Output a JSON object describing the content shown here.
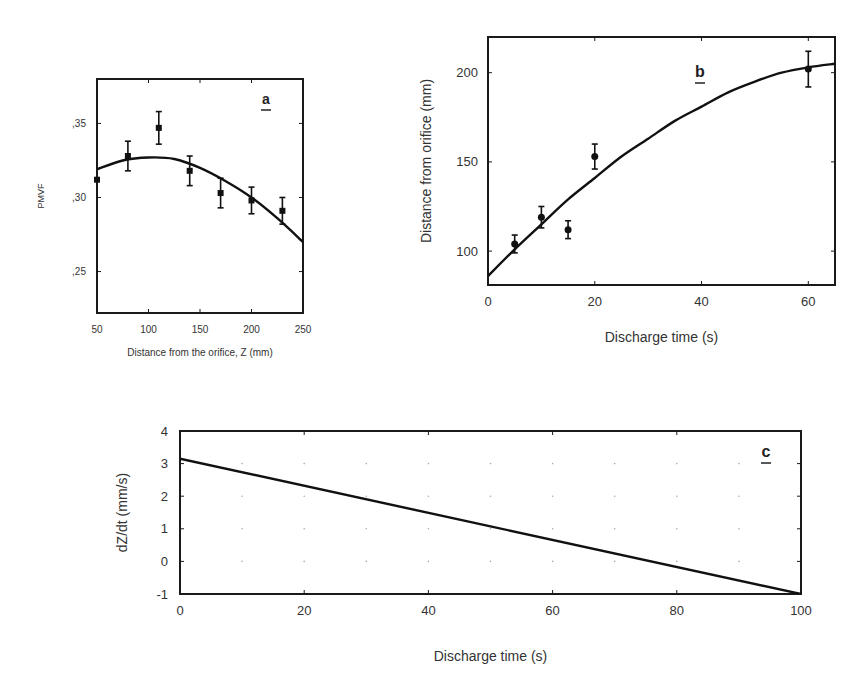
{
  "chart_data": [
    {
      "id": "a",
      "type": "scatter",
      "panel_label": "a",
      "title": "",
      "xlabel": "Distance from the orifice, Z  (mm)",
      "ylabel": "PMVF",
      "xlim": [
        50,
        250
      ],
      "ylim": [
        0.222,
        0.38
      ],
      "xticks": [
        50,
        100,
        150,
        200,
        250
      ],
      "xtick_labels": [
        "50",
        "100",
        "150",
        "200",
        "250"
      ],
      "yticks": [
        0.25,
        0.3,
        0.35
      ],
      "ytick_labels": [
        ",25",
        ",30",
        ",35"
      ],
      "grid": false,
      "series": [
        {
          "name": "measured",
          "marker": "square",
          "x": [
            50,
            80,
            110,
            140,
            170,
            200,
            230
          ],
          "y": [
            0.312,
            0.328,
            0.347,
            0.318,
            0.303,
            0.298,
            0.291
          ],
          "error": [
            0.0,
            0.01,
            0.011,
            0.01,
            0.01,
            0.009,
            0.009
          ]
        },
        {
          "name": "fit",
          "style": "line",
          "x": [
            50,
            75,
            100,
            125,
            150,
            175,
            200,
            225,
            250
          ],
          "y": [
            0.319,
            0.325,
            0.327,
            0.326,
            0.32,
            0.311,
            0.3,
            0.286,
            0.27
          ]
        }
      ]
    },
    {
      "id": "b",
      "type": "scatter",
      "panel_label": "b",
      "title": "",
      "xlabel": "Discharge time  (s)",
      "ylabel": "Distance from orifice (mm)",
      "xlim": [
        0,
        65
      ],
      "ylim": [
        81,
        220
      ],
      "xticks": [
        0,
        20,
        40,
        60
      ],
      "xtick_labels": [
        "0",
        "20",
        "40",
        "60"
      ],
      "yticks": [
        100,
        150,
        200
      ],
      "ytick_labels": [
        "100",
        "150",
        "200"
      ],
      "grid": false,
      "series": [
        {
          "name": "measured",
          "marker": "circle",
          "x": [
            5,
            10,
            15,
            20,
            60
          ],
          "y": [
            104,
            119,
            112,
            153,
            202
          ],
          "error": [
            5,
            6,
            5,
            7,
            10
          ]
        },
        {
          "name": "fit",
          "style": "line",
          "x": [
            0,
            5,
            10,
            15,
            20,
            25,
            30,
            35,
            40,
            45,
            50,
            55,
            60,
            65
          ],
          "y": [
            86,
            101,
            115,
            129,
            141,
            153,
            163,
            173,
            181,
            189,
            195,
            200,
            203,
            205
          ]
        }
      ]
    },
    {
      "id": "c",
      "type": "line",
      "panel_label": "c",
      "title": "",
      "xlabel": "Discharge time  (s)",
      "ylabel": "dZ/dt    (mm/s)",
      "xlim": [
        0,
        100
      ],
      "ylim": [
        -1,
        4
      ],
      "xticks": [
        0,
        20,
        40,
        60,
        80,
        100
      ],
      "xtick_labels": [
        "0",
        "20",
        "40",
        "60",
        "80",
        "100"
      ],
      "yticks": [
        -1,
        0,
        1,
        2,
        3,
        4
      ],
      "ytick_labels": [
        "-1",
        "0",
        "1",
        "2",
        "3",
        "4"
      ],
      "grid": "dotted",
      "series": [
        {
          "name": "dZ/dt",
          "style": "line",
          "x": [
            0,
            100
          ],
          "y": [
            3.15,
            -1.0
          ]
        }
      ]
    }
  ]
}
